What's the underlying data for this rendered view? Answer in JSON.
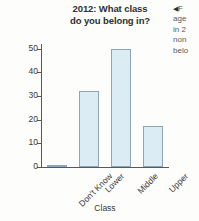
{
  "title": {
    "line1": "2012: What class",
    "line2": "do you belong in?"
  },
  "caption": {
    "arrow": "◀",
    "line1": "F",
    "line2": "age",
    "line3": "in 2",
    "line4": "non",
    "line5": "belo"
  },
  "colors": {
    "bar_fill": "#dcecf5",
    "bar_border": "#8ba6b8",
    "axis": "#55585c",
    "text": "#3a3a3a"
  },
  "chart_data": {
    "type": "bar",
    "title": "2012: What class do you belong in?",
    "xlabel": "Class",
    "ylabel": "Percentage",
    "categories": [
      "Don't Know",
      "Lower",
      "Middle",
      "Upper"
    ],
    "values": [
      1,
      32,
      50,
      17.5
    ],
    "ylim": [
      0,
      52
    ],
    "yticks": [
      0,
      10,
      20,
      30,
      40,
      50
    ],
    "ytick_labels": [
      "0",
      "10",
      "20",
      "30",
      "40",
      "50"
    ],
    "grid": false,
    "legend": null,
    "xtick_rotation": -45
  }
}
